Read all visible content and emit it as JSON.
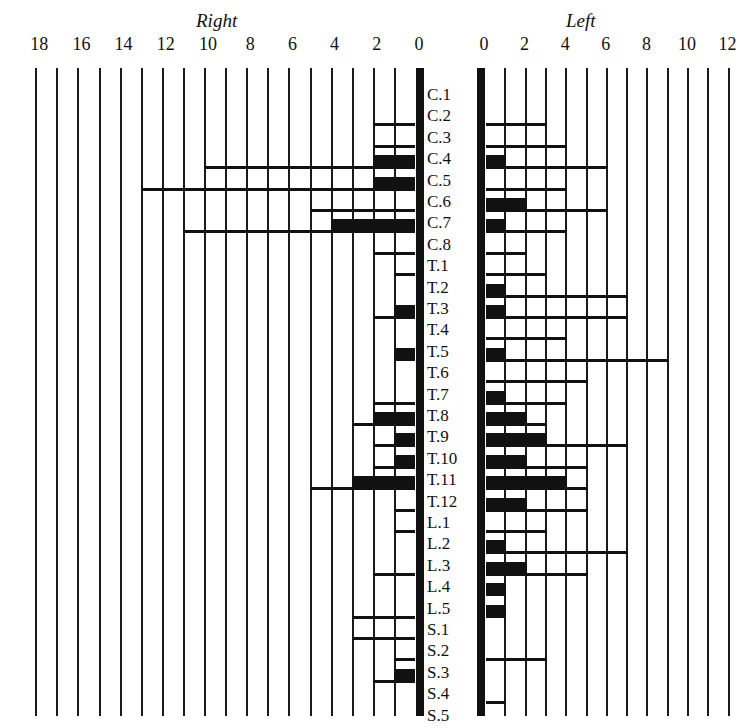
{
  "chart_data": {
    "type": "bar",
    "orientation": "horizontal-back-to-back",
    "title": "",
    "left_panel_title": "Right",
    "right_panel_title": "Left",
    "right_side_ticks": [
      "18",
      "16",
      "14",
      "12",
      "10",
      "8",
      "6",
      "4",
      "2",
      "0"
    ],
    "left_side_ticks": [
      "0",
      "2",
      "4",
      "6",
      "8",
      "10",
      "12"
    ],
    "right_side_range": [
      0,
      18
    ],
    "left_side_range": [
      0,
      12
    ],
    "grid": true,
    "categories": [
      "C.1",
      "C.2",
      "C.3",
      "C.4",
      "C.5",
      "C.6",
      "C.7",
      "C.8",
      "T.1",
      "T.2",
      "T.3",
      "T.4",
      "T.5",
      "T.6",
      "T.7",
      "T.8",
      "T.9",
      "T.10",
      "T.11",
      "T.12",
      "L.1",
      "L.2",
      "L.3",
      "L.4",
      "L.5",
      "S.1",
      "S.2",
      "S.3",
      "S.4",
      "S.5"
    ],
    "series": [
      {
        "name": "Right (filled bar)",
        "side": "right",
        "values": [
          0,
          0,
          0,
          2,
          2,
          0,
          4,
          0,
          0,
          0,
          1,
          0,
          1,
          0,
          0,
          2,
          1,
          1,
          3,
          0,
          0,
          0,
          0,
          0,
          0,
          0,
          0,
          1,
          0,
          0
        ]
      },
      {
        "name": "Right (line extent)",
        "side": "right",
        "values": [
          0,
          2,
          2,
          10,
          13,
          5,
          11,
          2,
          1,
          0,
          2,
          0,
          0,
          0,
          2,
          3,
          2,
          2,
          5,
          1,
          1,
          0,
          2,
          0,
          3,
          3,
          1,
          2,
          0,
          0
        ]
      },
      {
        "name": "Left (filled bar)",
        "side": "left",
        "values": [
          0,
          0,
          0,
          1,
          0,
          2,
          1,
          0,
          0,
          1,
          1,
          0,
          1,
          0,
          1,
          2,
          3,
          2,
          4,
          2,
          0,
          1,
          2,
          1,
          1,
          0,
          0,
          0,
          0,
          0
        ]
      },
      {
        "name": "Left (line extent)",
        "side": "left",
        "values": [
          0,
          3,
          4,
          6,
          4,
          6,
          4,
          2,
          3,
          7,
          7,
          4,
          9,
          5,
          4,
          3,
          7,
          5,
          5,
          5,
          3,
          7,
          5,
          0,
          0,
          0,
          3,
          0,
          1,
          0
        ]
      }
    ]
  }
}
